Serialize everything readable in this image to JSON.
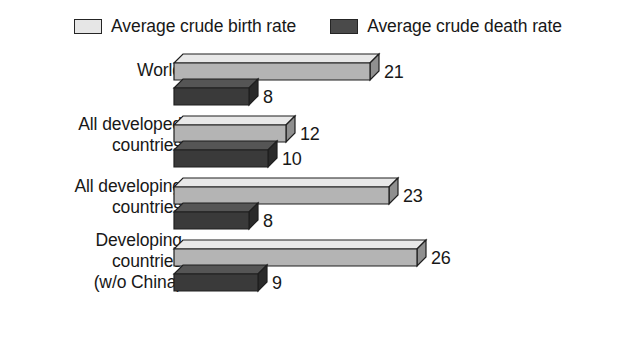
{
  "legend": {
    "entries": [
      {
        "label": "Average crude birth rate",
        "swatch": "light",
        "color": "#e6e6e6"
      },
      {
        "label": "Average crude death rate",
        "swatch": "dark",
        "color": "#4a4a4a"
      }
    ]
  },
  "colors": {
    "birth_top": "#e8e8e8",
    "birth_front": "#b4b4b4",
    "birth_side": "#8f8f8f",
    "death_top": "#555555",
    "death_front": "#3a3a3a",
    "death_side": "#2a2a2a",
    "outline": "#1f1f1f",
    "text": "#181818",
    "background": "#ffffff"
  },
  "chart_data": {
    "type": "bar",
    "orientation": "horizontal",
    "style": "3d-bar",
    "title": "",
    "xlabel": "",
    "ylabel": "",
    "grid": false,
    "legend_position": "top-center",
    "xlim": [
      0,
      26
    ],
    "categories": [
      "World",
      "All developed\ncountries",
      "All developing\ncountries",
      "Developing\ncountries\n(w/o China)"
    ],
    "series": [
      {
        "name": "Average crude birth rate",
        "values": [
          21,
          12,
          23,
          26
        ]
      },
      {
        "name": "Average crude death rate",
        "values": [
          8,
          10,
          8,
          9
        ]
      }
    ]
  }
}
